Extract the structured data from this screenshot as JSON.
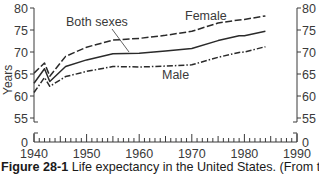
{
  "chart_data": {
    "type": "line",
    "title": "",
    "xlabel": "",
    "ylabel": "Years",
    "xlim": [
      1940,
      1990
    ],
    "ylim": [
      55,
      80
    ],
    "y_axis_break": {
      "below": 55,
      "zero_label": "0"
    },
    "x_ticks": [
      1940,
      1950,
      1960,
      1970,
      1980,
      1990
    ],
    "y_ticks": [
      0,
      55,
      60,
      65,
      70,
      75,
      80
    ],
    "grid": false,
    "legend": "inline labels",
    "x": [
      1940,
      1942,
      1943,
      1946,
      1950,
      1955,
      1960,
      1965,
      1970,
      1975,
      1979,
      1980,
      1984
    ],
    "series": [
      {
        "name": "Female",
        "style": "dashed",
        "values": [
          65.2,
          67.5,
          64.5,
          69.0,
          71.1,
          72.7,
          73.1,
          73.8,
          74.7,
          76.6,
          77.3,
          77.4,
          78.2
        ]
      },
      {
        "name": "Both sexes",
        "style": "solid",
        "values": [
          62.9,
          66.2,
          63.3,
          66.7,
          68.2,
          69.6,
          69.7,
          70.2,
          70.8,
          72.6,
          73.7,
          73.7,
          74.7
        ]
      },
      {
        "name": "Male",
        "style": "dash-dot",
        "values": [
          60.8,
          64.2,
          62.2,
          64.4,
          65.6,
          66.7,
          66.6,
          66.8,
          67.1,
          68.8,
          69.9,
          70.0,
          71.2
        ]
      }
    ],
    "annotations": [
      {
        "text": "Female",
        "near_x": 1966,
        "near_y": 76.5
      },
      {
        "text": "Both sexes",
        "near_x": 1951,
        "near_y": 76,
        "leader_to": [
          1963,
          70.0
        ]
      },
      {
        "text": "Male",
        "near_x": 1965,
        "near_y": 64
      }
    ]
  },
  "labels": {
    "ylabel": "Years",
    "female": "Female",
    "both": "Both sexes",
    "male": "Male",
    "zero": "0"
  },
  "caption": {
    "figure_label": "Figure 28-1",
    "text": " Life expectancy in the United States. (From the"
  }
}
